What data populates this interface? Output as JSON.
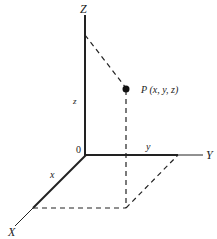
{
  "diagram": {
    "type": "3d-coordinate-system",
    "axes": {
      "x_label": "X",
      "y_label": "Y",
      "z_label": "Z",
      "origin_label": "0"
    },
    "component_labels": {
      "x": "x",
      "y": "y",
      "z": "z"
    },
    "point": {
      "label": "P (x, y, z)"
    },
    "colors": {
      "line": "#222222",
      "background": "#ffffff"
    }
  }
}
